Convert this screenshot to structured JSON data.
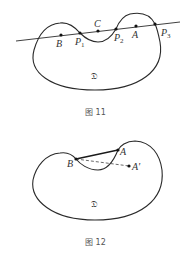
{
  "colors": {
    "stroke": "#2a2a2a",
    "text": "#333333",
    "caption": "#555555",
    "background": "#ffffff"
  },
  "figures": [
    {
      "caption": "图 11",
      "region_label": "𝔇",
      "line": {
        "from": [
          16,
          41
        ],
        "to": [
          180,
          22
        ]
      },
      "points": [
        {
          "name": "B",
          "sub": "",
          "x": 61,
          "y": 35,
          "lx": 56,
          "ly": 47
        },
        {
          "name": "P",
          "sub": "1",
          "x": 80,
          "y": 33,
          "lx": 75,
          "ly": 45
        },
        {
          "name": "C",
          "sub": "",
          "x": 98,
          "y": 31,
          "lx": 94,
          "ly": 27
        },
        {
          "name": "P",
          "sub": "2",
          "x": 116,
          "y": 29,
          "lx": 114,
          "ly": 41
        },
        {
          "name": "A",
          "sub": "",
          "x": 136,
          "y": 26,
          "lx": 132,
          "ly": 38
        },
        {
          "name": "P",
          "sub": "3",
          "x": 155,
          "y": 24,
          "lx": 161,
          "ly": 36
        }
      ]
    },
    {
      "caption": "图 12",
      "region_label": "𝔇",
      "points": [
        {
          "name": "B",
          "x": 76,
          "y": 159,
          "lx": 67,
          "ly": 167
        },
        {
          "name": "A",
          "x": 118,
          "y": 150,
          "lx": 120,
          "ly": 155
        },
        {
          "name": "A'",
          "x": 129,
          "y": 166,
          "lx": 132,
          "ly": 170
        }
      ]
    }
  ]
}
